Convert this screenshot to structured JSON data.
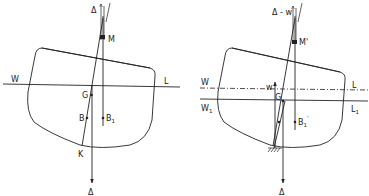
{
  "figure": {
    "left_panel": {
      "description": "Ship section heeled, upright condition",
      "labels": {
        "delta_top": "Δ",
        "metacentre": "M",
        "waterline_left": "W",
        "waterline_right": "L",
        "gravity": "G",
        "buoyancy": "B",
        "buoyancy_shifted": "B",
        "buoyancy_shifted_sub": "1",
        "keel": "K",
        "delta_bottom": "Δ"
      }
    },
    "right_panel": {
      "description": "Ship section grounded, with reduced buoyancy",
      "labels": {
        "delta_top": "Δ - w",
        "metacentre": "M'",
        "waterline_left": "W",
        "waterline_right": "L",
        "waterline1_left": "W",
        "waterline1_left_sub": "1",
        "waterline1_right": "L",
        "waterline1_right_sub": "1",
        "force_w": "w",
        "gravity": "G",
        "buoyancy": "B",
        "buoyancy_sub": "1",
        "buoyancy_prime": "'",
        "delta_bottom": "Δ"
      }
    },
    "colors": {
      "ink": "#222222",
      "background": "#ffffff"
    }
  }
}
